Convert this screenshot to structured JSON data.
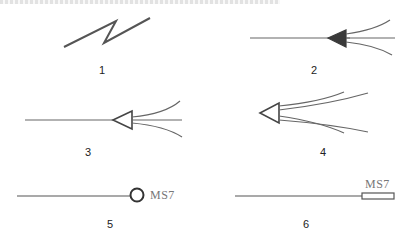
{
  "figure": {
    "symbols": [
      {
        "id": 1,
        "label": "1",
        "shape": "lightning-zigzag-line"
      },
      {
        "id": 2,
        "label": "2",
        "shape": "line-filled-arrowhead-fanout"
      },
      {
        "id": 3,
        "label": "3",
        "shape": "line-hollow-arrowhead-fanout"
      },
      {
        "id": 4,
        "label": "4",
        "shape": "hollow-arrowhead-multi-fanout"
      },
      {
        "id": 5,
        "label": "5",
        "shape": "line-circle-terminal",
        "tag": "MS7"
      },
      {
        "id": 6,
        "label": "6",
        "shape": "line-rectangle-terminal",
        "tag": "MS7"
      }
    ],
    "colors": {
      "stroke": "#555555",
      "fill": "#3a3a3a",
      "text": "#222222",
      "tag_text": "#777777"
    }
  }
}
